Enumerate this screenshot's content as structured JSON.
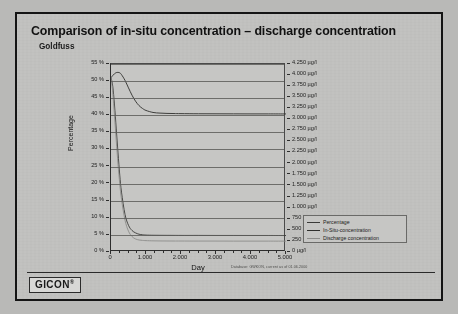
{
  "slide": {
    "title": "Comparison of in-situ concentration – discharge concentration",
    "subtitle": "Goldfuss",
    "logo": "GICON",
    "logo_mark": "®",
    "source_note": "Database: GWKON, current as of 01.06.2000"
  },
  "chart_data": {
    "type": "line",
    "title": "Comparison of in-situ concentration – discharge concentration",
    "subtitle": "Goldfuss",
    "xlabel": "Day",
    "ylabel": "Percentage",
    "y2label": "",
    "xlim": [
      0,
      5000
    ],
    "ylim": [
      0,
      55
    ],
    "y2lim": [
      0,
      4250
    ],
    "grid": true,
    "legend_position": "bottom-right",
    "xticks": [
      0,
      1000,
      2000,
      3000,
      4000,
      5000
    ],
    "xticklabels": [
      "0",
      "1.000",
      "2.000",
      "3.000",
      "4.000",
      "5.000"
    ],
    "yticks": [
      0,
      5,
      10,
      15,
      20,
      25,
      30,
      35,
      40,
      45,
      50,
      55
    ],
    "yticklabels": [
      "0 %",
      "5 %",
      "10 %",
      "15 %",
      "20 %",
      "25 %",
      "30 %",
      "35 %",
      "40 %",
      "45 %",
      "50 %",
      "55 %"
    ],
    "y2ticks": [
      0,
      250,
      500,
      750,
      1000,
      1250,
      1500,
      1750,
      2000,
      2250,
      2500,
      2750,
      3000,
      3250,
      3500,
      3750,
      4000,
      4250
    ],
    "y2ticklabels": [
      "0 µg/l",
      "250 µg/l",
      "500 µg/l",
      "750 µg/l",
      "1.000 µg/l",
      "1.250 µg/l",
      "1.500 µg/l",
      "1.750 µg/l",
      "2.000 µg/l",
      "2.250 µg/l",
      "2.500 µg/l",
      "2.750 µg/l",
      "3.000 µg/l",
      "3.250 µg/l",
      "3.500 µg/l",
      "3.750 µg/l",
      "4.000 µg/l",
      "4.250 µg/l"
    ],
    "x": [
      0,
      50,
      100,
      150,
      200,
      250,
      300,
      400,
      500,
      600,
      700,
      800,
      900,
      1000,
      1200,
      1400,
      1600,
      1800,
      2000,
      2500,
      3000,
      3500,
      4000,
      4500,
      5000
    ],
    "series": [
      {
        "name": "Percentage",
        "color": "#3a3a38",
        "axis": "left",
        "units": "%",
        "values": [
          51.0,
          48.5,
          43.0,
          36.0,
          29.0,
          22.5,
          17.5,
          11.0,
          7.8,
          6.3,
          5.6,
          5.2,
          5.05,
          4.95,
          4.9,
          4.88,
          4.87,
          4.86,
          4.85,
          4.85,
          4.84,
          4.84,
          4.83,
          4.83,
          4.82
        ]
      },
      {
        "name": "In-Situ-concentration",
        "color": "#2f2f2d",
        "axis": "right",
        "units": "µg/l",
        "values": [
          3940,
          3990,
          4030,
          4055,
          4060,
          4050,
          4010,
          3880,
          3710,
          3545,
          3410,
          3310,
          3245,
          3200,
          3155,
          3140,
          3133,
          3130,
          3128,
          3125,
          3124,
          3123,
          3122,
          3122,
          3121
        ]
      },
      {
        "name": "Discharge concentration",
        "color": "#8c8c8a",
        "axis": "right",
        "units": "µg/l",
        "values": [
          3940,
          3600,
          3080,
          2520,
          1990,
          1540,
          1190,
          720,
          470,
          350,
          295,
          272,
          262,
          257,
          252,
          250,
          249,
          248,
          248,
          247,
          247,
          246,
          246,
          246,
          245
        ]
      }
    ],
    "annotations": []
  },
  "legend": {
    "items": [
      {
        "label": "Percentage",
        "color": "#3a3a38"
      },
      {
        "label": "In-Situ-concentration",
        "color": "#2f2f2d"
      },
      {
        "label": "Discharge concentration",
        "color": "#8c8c8a"
      }
    ]
  }
}
